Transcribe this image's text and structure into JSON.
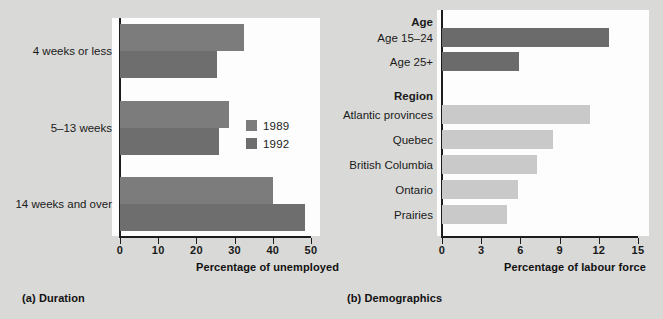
{
  "figure": {
    "background_color": "#d9d9d7",
    "panels": [
      {
        "caption": "(a) Duration",
        "axis_title": "Percentage of unemployed"
      },
      {
        "caption": "(b) Demographics",
        "axis_title": "Percentage of labour force"
      }
    ]
  },
  "chart_data": [
    {
      "type": "bar",
      "orientation": "horizontal",
      "title": "(a) Duration",
      "xlabel": "Percentage of unemployed",
      "ylabel": "",
      "xlim": [
        0,
        50
      ],
      "xticks": [
        0,
        10,
        20,
        30,
        40,
        50
      ],
      "xtick_labels": [
        "0",
        "10",
        "20",
        "30",
        "40",
        "50"
      ],
      "grid": false,
      "legend_position": "inside-right",
      "categories": [
        "4 weeks or less",
        "5–13 weeks",
        "14 weeks and over"
      ],
      "series": [
        {
          "name": "1989",
          "color": "#7c7c7c",
          "values": [
            32.5,
            28.5,
            40.0
          ]
        },
        {
          "name": "1992",
          "color": "#6e6e6e",
          "values": [
            25.5,
            26.0,
            48.5
          ]
        }
      ]
    },
    {
      "type": "bar",
      "orientation": "horizontal",
      "title": "(b) Demographics",
      "xlabel": "Percentage of labour force",
      "ylabel": "",
      "xlim": [
        0,
        15
      ],
      "xticks": [
        0,
        3,
        6,
        9,
        12,
        15
      ],
      "xtick_labels": [
        "0",
        "3",
        "6",
        "9",
        "12",
        "15"
      ],
      "grid": false,
      "legend_position": "none",
      "group_headings": [
        "Age",
        "Region"
      ],
      "categories": [
        "Age 15–24",
        "Age 25+",
        "Atlantic provinces",
        "Quebec",
        "British Columbia",
        "Ontario",
        "Prairies"
      ],
      "series": [
        {
          "name": "Age",
          "color": "#6b6b6b",
          "categories": [
            "Age 15–24",
            "Age 25+"
          ],
          "values": [
            12.8,
            5.9
          ]
        },
        {
          "name": "Region",
          "color": "#c9c9c9",
          "categories": [
            "Atlantic provinces",
            "Quebec",
            "British Columbia",
            "Ontario",
            "Prairies"
          ],
          "values": [
            11.3,
            8.5,
            7.3,
            5.8,
            5.0
          ]
        }
      ]
    }
  ],
  "panel_a": {
    "caption": "(a) Duration",
    "axis_title": "Percentage of unemployed",
    "xticks": [
      "0",
      "10",
      "20",
      "30",
      "40",
      "50"
    ],
    "categories": [
      "4 weeks or less",
      "5–13 weeks",
      "14 weeks and over"
    ],
    "legend": [
      {
        "label": "1989",
        "color": "#7c7c7c"
      },
      {
        "label": "1992",
        "color": "#6e6e6e"
      }
    ]
  },
  "panel_b": {
    "caption": "(b) Demographics",
    "axis_title": "Percentage of labour force",
    "xticks": [
      "0",
      "3",
      "6",
      "9",
      "12",
      "15"
    ],
    "rows": [
      {
        "label": "Age",
        "kind": "heading"
      },
      {
        "label": "Age 15–24",
        "kind": "bar"
      },
      {
        "label": "Age 25+",
        "kind": "bar"
      },
      {
        "label": "Region",
        "kind": "heading"
      },
      {
        "label": "Atlantic provinces",
        "kind": "bar"
      },
      {
        "label": "Quebec",
        "kind": "bar"
      },
      {
        "label": "British Columbia",
        "kind": "bar"
      },
      {
        "label": "Ontario",
        "kind": "bar"
      },
      {
        "label": "Prairies",
        "kind": "bar"
      }
    ]
  }
}
